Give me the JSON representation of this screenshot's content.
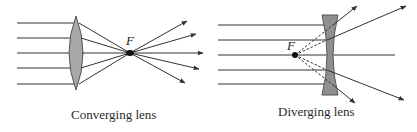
{
  "figure": {
    "colors": {
      "ray": "#333333",
      "lens_fill": "#a8a8a8",
      "lens_stroke": "#555555",
      "focal_point": "#111111",
      "background": "#ffffff"
    },
    "panels": [
      {
        "id": "converging",
        "caption": "Converging lens",
        "focal_label": "F",
        "lens_type": "convex",
        "incoming_ray_count": 5,
        "rays_converge_at_focal_point": true
      },
      {
        "id": "diverging",
        "caption": "Diverging lens",
        "focal_label": "F",
        "lens_type": "concave",
        "incoming_ray_count": 5,
        "rays_appear_to_diverge_from_focal_point": true,
        "virtual_rays_dashed": true
      }
    ]
  }
}
